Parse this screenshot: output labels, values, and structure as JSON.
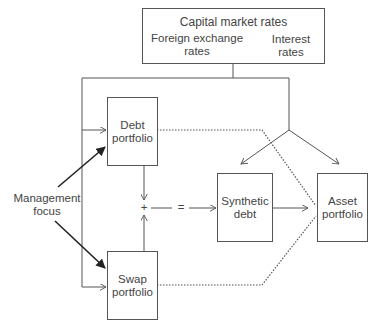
{
  "diagram": {
    "top_box": {
      "title": "Capital market rates",
      "left_label_line1": "Foreign exchange",
      "left_label_line2": "rates",
      "right_label_line1": "Interest",
      "right_label_line2": "rates"
    },
    "debt_portfolio": {
      "line1": "Debt",
      "line2": "portfolio"
    },
    "swap_portfolio": {
      "line1": "Swap",
      "line2": "portfolio"
    },
    "synthetic_debt": {
      "line1": "Synthetic",
      "line2": "debt"
    },
    "asset_portfolio": {
      "line1": "Asset",
      "line2": "portfolio"
    },
    "management_focus": {
      "line1": "Management",
      "line2": "focus"
    },
    "operators": {
      "plus": "+",
      "equals": "="
    },
    "colors": {
      "line": "#555555",
      "text": "#444444",
      "bold_arrow": "#222222"
    }
  }
}
